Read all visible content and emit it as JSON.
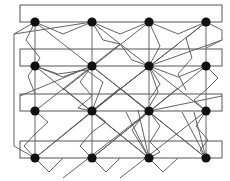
{
  "figure": {
    "title": "",
    "caption": "",
    "type": "node-link-network-diagram",
    "background_color": "#ffffff",
    "width": 230,
    "height": 181
  },
  "style": {
    "node_color": "#111111",
    "node_radius": 4.6,
    "bar_stroke": "#555555",
    "bar_fill": "none",
    "bar_stroke_width": 1.0,
    "column_stroke": "#666666",
    "column_stroke_width": 1.0,
    "wire_stroke": "#5a5a5a",
    "wire_stroke_width": 0.95
  },
  "grid": {
    "columns_x": [
      35,
      92,
      149,
      206
    ],
    "rows_y": [
      22,
      66,
      111,
      158
    ],
    "bar_left": 20,
    "bar_right": 222,
    "bar_height": 17,
    "column_count": 4,
    "row_count": 4,
    "node_count": 16
  },
  "bars": [
    {
      "id": "bus-bar-1",
      "x": 20,
      "y": 5,
      "w": 202,
      "h": 17
    },
    {
      "id": "bus-bar-2",
      "x": 20,
      "y": 49,
      "w": 202,
      "h": 17
    },
    {
      "id": "bus-bar-3",
      "x": 20,
      "y": 94,
      "w": 202,
      "h": 17
    },
    {
      "id": "bus-bar-4",
      "x": 20,
      "y": 141,
      "w": 202,
      "h": 17
    }
  ],
  "nodes": [
    {
      "id": "n-r1c1",
      "x": 35,
      "y": 22,
      "row": 1,
      "col": 1
    },
    {
      "id": "n-r1c2",
      "x": 92,
      "y": 22,
      "row": 1,
      "col": 2
    },
    {
      "id": "n-r1c3",
      "x": 149,
      "y": 22,
      "row": 1,
      "col": 3
    },
    {
      "id": "n-r1c4",
      "x": 206,
      "y": 22,
      "row": 1,
      "col": 4
    },
    {
      "id": "n-r2c1",
      "x": 35,
      "y": 66,
      "row": 2,
      "col": 1
    },
    {
      "id": "n-r2c2",
      "x": 92,
      "y": 66,
      "row": 2,
      "col": 2
    },
    {
      "id": "n-r2c3",
      "x": 149,
      "y": 66,
      "row": 2,
      "col": 3
    },
    {
      "id": "n-r2c4",
      "x": 206,
      "y": 66,
      "row": 2,
      "col": 4
    },
    {
      "id": "n-r3c1",
      "x": 35,
      "y": 111,
      "row": 3,
      "col": 1
    },
    {
      "id": "n-r3c2",
      "x": 92,
      "y": 111,
      "row": 3,
      "col": 2
    },
    {
      "id": "n-r3c3",
      "x": 149,
      "y": 111,
      "row": 3,
      "col": 3
    },
    {
      "id": "n-r3c4",
      "x": 206,
      "y": 111,
      "row": 3,
      "col": 4
    },
    {
      "id": "n-r4c1",
      "x": 35,
      "y": 158,
      "row": 4,
      "col": 1
    },
    {
      "id": "n-r4c2",
      "x": 92,
      "y": 158,
      "row": 4,
      "col": 2
    },
    {
      "id": "n-r4c3",
      "x": 149,
      "y": 158,
      "row": 4,
      "col": 3
    },
    {
      "id": "n-r4c4",
      "x": 206,
      "y": 158,
      "row": 4,
      "col": 4
    }
  ],
  "column_lines": [
    {
      "id": "col-line-1",
      "x": 35,
      "y1": 22,
      "y2": 158
    },
    {
      "id": "col-line-2",
      "x": 92,
      "y1": 22,
      "y2": 158
    },
    {
      "id": "col-line-3",
      "x": 149,
      "y1": 22,
      "y2": 158
    },
    {
      "id": "col-line-4",
      "x": 206,
      "y1": 22,
      "y2": 158
    }
  ],
  "wires": [
    {
      "id": "w-left-loop",
      "points": "35,22 14,34 14,146 35,158"
    },
    {
      "id": "w-right-hook",
      "points": "206,22 222,30 222,40 206,48"
    },
    {
      "id": "w-r1-chev-a",
      "points": "35,22 63,34 92,22"
    },
    {
      "id": "w-r1-chev-b",
      "points": "92,22 120,34 149,22"
    },
    {
      "id": "w-r1-chev-c",
      "points": "149,22 178,34 206,22"
    },
    {
      "id": "w-r2-chev-a",
      "points": "35,66 63,77 92,66"
    },
    {
      "id": "w-r2-chev-b",
      "points": "149,66 178,77 206,66"
    },
    {
      "id": "w-r4-chev-a",
      "points": "35,158 49,172 63,158"
    },
    {
      "id": "w-r4-chev-b",
      "points": "92,158 106,172 120,158"
    },
    {
      "id": "w-r4-chev-c",
      "points": "149,158 163,172 178,158"
    },
    {
      "id": "w-d1",
      "points": "35,22 149,111"
    },
    {
      "id": "w-d2",
      "points": "92,22 206,111"
    },
    {
      "id": "w-d3",
      "points": "149,22 63,90"
    },
    {
      "id": "w-d4",
      "points": "206,22 92,111"
    },
    {
      "id": "w-d5",
      "points": "35,66 149,158"
    },
    {
      "id": "w-d6",
      "points": "92,66 206,158"
    },
    {
      "id": "w-d7",
      "points": "149,66 35,158"
    },
    {
      "id": "w-d8",
      "points": "206,66 92,158"
    },
    {
      "id": "w-d9",
      "points": "35,111 120,44"
    },
    {
      "id": "w-d10",
      "points": "92,111 178,44"
    },
    {
      "id": "w-d11",
      "points": "149,111 63,178"
    },
    {
      "id": "w-d12",
      "points": "206,111 120,178"
    },
    {
      "id": "w-d13",
      "points": "35,158 120,88"
    },
    {
      "id": "w-d14",
      "points": "92,158 178,88"
    },
    {
      "id": "w-d15",
      "points": "206,158 120,88"
    },
    {
      "id": "w-d16",
      "points": "149,158 63,88"
    },
    {
      "id": "w-s1",
      "points": "92,22 103,40 120,44 132,60 149,66"
    },
    {
      "id": "w-s2",
      "points": "149,22 160,46 149,66 160,84 149,100"
    },
    {
      "id": "w-s3",
      "points": "35,66 58,74 86,70 103,82 92,111"
    },
    {
      "id": "w-s4",
      "points": "206,66 218,78 206,90 194,100 206,111"
    },
    {
      "id": "w-s5",
      "points": "149,66 158,92 146,112 132,130 149,158"
    },
    {
      "id": "w-s6",
      "points": "92,111 106,122 92,132 80,146 92,158"
    },
    {
      "id": "w-s7",
      "points": "35,111 48,122 35,134 24,146 35,158"
    },
    {
      "id": "w-s8",
      "points": "206,111 196,126 208,140 200,150 206,158"
    },
    {
      "id": "w-s9",
      "points": "206,22 186,38 192,58 178,74 186,90"
    },
    {
      "id": "w-s10",
      "points": "35,22 26,40 40,58 28,76 35,94"
    },
    {
      "id": "w-s11",
      "points": "149,111 160,126 150,142 160,152 149,158"
    },
    {
      "id": "w-s12",
      "points": "92,66 80,82 92,96 78,108 92,111"
    },
    {
      "id": "w-fan1",
      "points": "149,158 126,112"
    },
    {
      "id": "w-fan2",
      "points": "149,158 138,110"
    },
    {
      "id": "w-fan3",
      "points": "206,158 182,112"
    },
    {
      "id": "w-fan4",
      "points": "206,158 194,112"
    },
    {
      "id": "w-long1",
      "points": "14,34 92,22"
    },
    {
      "id": "w-long2",
      "points": "222,40 149,66"
    },
    {
      "id": "w-long3",
      "points": "20,96 92,66"
    },
    {
      "id": "w-long4",
      "points": "222,96 149,111"
    }
  ]
}
